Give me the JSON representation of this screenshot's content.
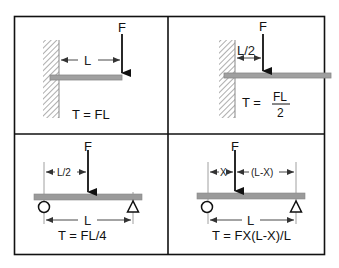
{
  "colors": {
    "frame": "#111111",
    "beam_fill": "#9a9a9a",
    "beam_stroke": "#7a7a7a",
    "wall_hatch": "#777777",
    "arrow": "#111111",
    "dim_line": "#444444"
  },
  "panels": [
    {
      "id": "cantilever-end-load",
      "force_label": "F",
      "dimension_label": "L",
      "formula": "T = FL"
    },
    {
      "id": "cantilever-mid-load",
      "force_label": "F",
      "dimension_label": "L/2",
      "formula_prefix": "T =",
      "formula_numerator": "FL",
      "formula_denominator": "2"
    },
    {
      "id": "simply-supported-center-load",
      "force_label": "F",
      "half_dimension_label": "L/2",
      "span_label": "L",
      "formula": "T = FL/4"
    },
    {
      "id": "simply-supported-offset-load",
      "force_label": "F",
      "x_dimension_label": "X",
      "remaining_dimension_label": "(L-X)",
      "span_label": "L",
      "formula": "T = FX(L-X)/L"
    }
  ]
}
